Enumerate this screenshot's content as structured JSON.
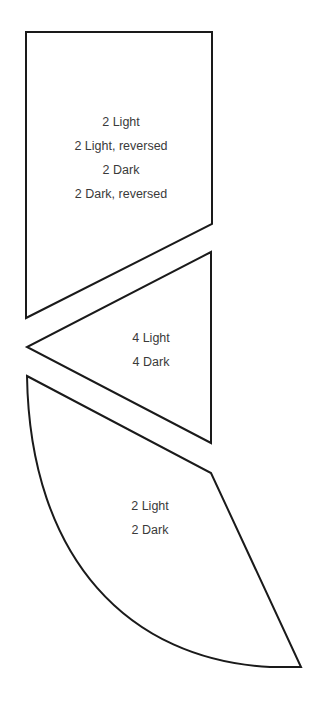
{
  "diagram": {
    "type": "pattern-pieces",
    "stroke_color": "#1a1a1a",
    "text_color": "#3a3a3a",
    "pieces": [
      {
        "name": "pentagon-piece",
        "shape": "pentagon",
        "labels": [
          "2 Light",
          "2 Light, reversed",
          "2 Dark",
          "2 Dark, reversed"
        ]
      },
      {
        "name": "triangle-piece",
        "shape": "triangle",
        "labels": [
          "4 Light",
          "4 Dark"
        ]
      },
      {
        "name": "curved-wedge-piece",
        "shape": "curved wedge",
        "labels": [
          "2 Light",
          "2 Dark"
        ]
      }
    ]
  }
}
